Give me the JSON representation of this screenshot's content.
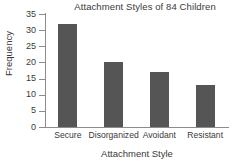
{
  "chart_data": {
    "type": "bar",
    "title": "Attachment Styles of 84 Children",
    "xlabel": "Attachment Style",
    "ylabel": "Frequency",
    "categories": [
      "Secure",
      "Disorganized",
      "Avoidant",
      "Resistant"
    ],
    "values": [
      32,
      20,
      17,
      13
    ],
    "ylim": [
      0,
      35
    ],
    "yticks": [
      0,
      5,
      10,
      15,
      20,
      25,
      30,
      35
    ],
    "ytick_labels": [
      "0",
      "5",
      "10",
      "15",
      "20",
      "25",
      "30",
      "35"
    ],
    "grid": false,
    "legend": "none",
    "bar_color": "#555555",
    "axis_color": "#8c8c8c",
    "text_color": "#3a3a3a",
    "background": "#ffffff"
  }
}
